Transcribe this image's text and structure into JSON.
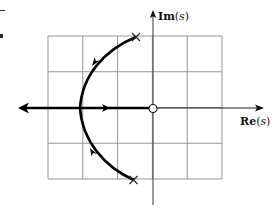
{
  "diagram": {
    "type": "root-locus",
    "axes": {
      "real_label": "Re",
      "imag_label": "Im",
      "variable": "s"
    },
    "grid": {
      "columns": 5,
      "rows": 4
    },
    "poles": [
      {
        "re": -0.5,
        "im": 2.0,
        "marker": "x"
      },
      {
        "re": -0.5,
        "im": -2.0,
        "marker": "x"
      }
    ],
    "zeros": [
      {
        "re": 0,
        "im": 0,
        "marker": "o"
      }
    ],
    "break_in_point": {
      "re": -2.0,
      "im": 0
    },
    "branches": [
      {
        "from": "pole-upper",
        "to": "break-in",
        "direction": "toward-break-in"
      },
      {
        "from": "pole-lower",
        "to": "break-in",
        "direction": "toward-break-in"
      },
      {
        "from": "break-in",
        "to": "-infinity",
        "direction": "left"
      },
      {
        "from": "break-in",
        "to": "zero-origin",
        "direction": "right"
      }
    ],
    "colors": {
      "grid": "#8a8a8a",
      "axes": "#333333",
      "locus": "#000000"
    }
  }
}
